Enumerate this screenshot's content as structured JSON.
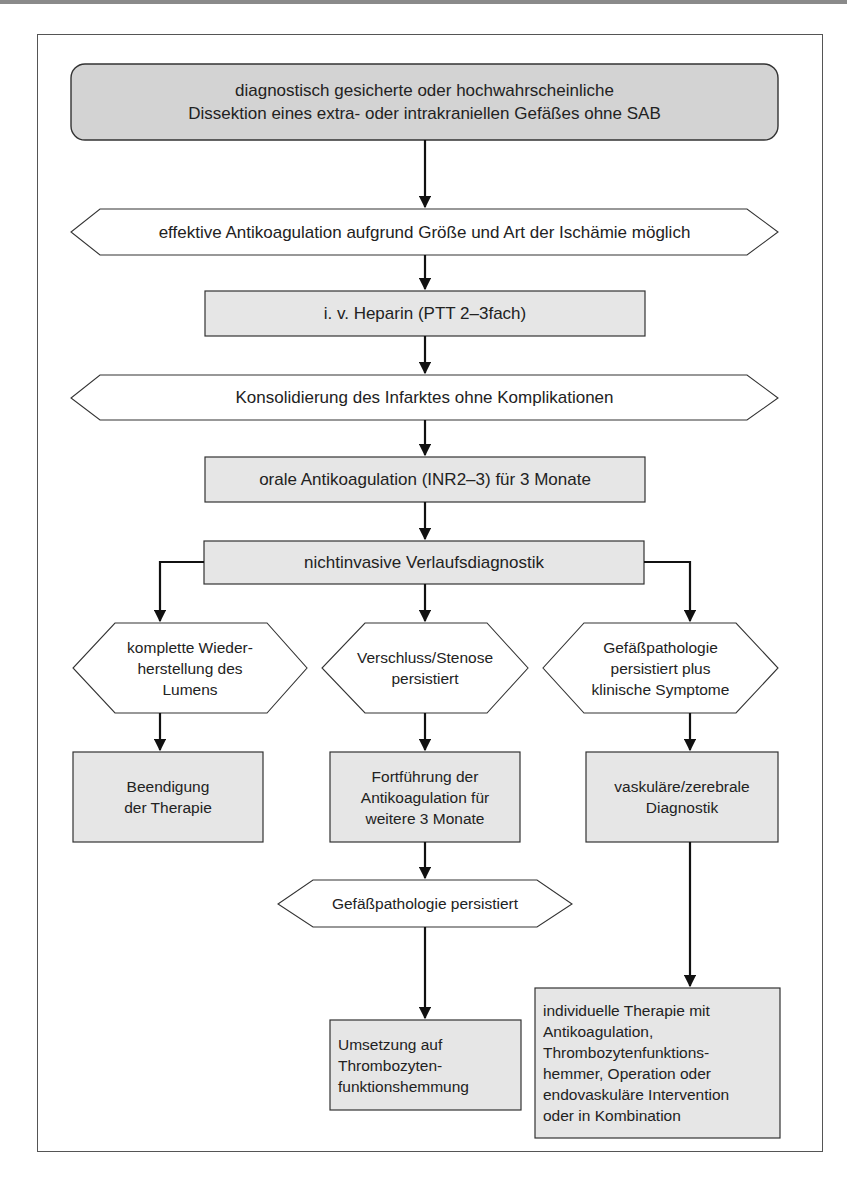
{
  "diagram": {
    "type": "flowchart",
    "language": "de",
    "colors": {
      "start_fill": "#d3d3d3",
      "box_fill": "#e6e6e6",
      "decision_fill": "#ffffff",
      "stroke": "#333333",
      "arrow": "#111111"
    },
    "nodes": {
      "start": {
        "shape": "rounded-rect",
        "label": "diagnostisch gesicherte oder hochwahrscheinliche\nDissektion eines extra- oder intrakraniellen Gefäßes ohne SAB"
      },
      "decision_anticoag": {
        "shape": "hexagon",
        "label": "effektive Antikoagulation aufgrund Größe und Art der Ischämie möglich"
      },
      "heparin": {
        "shape": "rect",
        "label": "i. v. Heparin (PTT 2–3fach)"
      },
      "decision_konsolidierung": {
        "shape": "hexagon",
        "label": "Konsolidierung des Infarktes ohne Komplikationen"
      },
      "oral_anticoag": {
        "shape": "rect",
        "label": "orale Antikoagulation (INR2–3) für 3 Monate"
      },
      "verlaufsdiagnostik": {
        "shape": "rect",
        "label": "nichtinvasive Verlaufsdiagnostik"
      },
      "decision_lumen": {
        "shape": "hexagon",
        "label": "komplette Wieder-\nherstellung des\nLumens"
      },
      "decision_stenose": {
        "shape": "hexagon",
        "label": "Verschluss/Stenose\npersistiert"
      },
      "decision_symptome": {
        "shape": "hexagon",
        "label": "Gefäßpathologie\npersistiert plus\nklinische Symptome"
      },
      "beendigung": {
        "shape": "rect",
        "label": "Beendigung\nder Therapie"
      },
      "fortfuehrung": {
        "shape": "rect",
        "label": "Fortführung der\nAntikoagulation für\nweitere 3 Monate"
      },
      "vaskulaere_diagnostik": {
        "shape": "rect",
        "label": "vaskuläre/zerebrale\nDiagnostik"
      },
      "decision_persistiert": {
        "shape": "hexagon",
        "label": "Gefäßpathologie persistiert"
      },
      "umsetzung": {
        "shape": "rect",
        "label": "Umsetzung auf\nThrombozyten-\nfunktionshemmung"
      },
      "individuelle_therapie": {
        "shape": "rect",
        "label": "individuelle Therapie mit\nAntikoagulation,\nThrombozytenfunktions-\nhemmer, Operation oder\nendovaskuläre Intervention\noder in Kombination"
      }
    },
    "edges": [
      [
        "start",
        "decision_anticoag"
      ],
      [
        "decision_anticoag",
        "heparin"
      ],
      [
        "heparin",
        "decision_konsolidierung"
      ],
      [
        "decision_konsolidierung",
        "oral_anticoag"
      ],
      [
        "oral_anticoag",
        "verlaufsdiagnostik"
      ],
      [
        "verlaufsdiagnostik",
        "decision_lumen"
      ],
      [
        "verlaufsdiagnostik",
        "decision_stenose"
      ],
      [
        "verlaufsdiagnostik",
        "decision_symptome"
      ],
      [
        "decision_lumen",
        "beendigung"
      ],
      [
        "decision_stenose",
        "fortfuehrung"
      ],
      [
        "decision_symptome",
        "vaskulaere_diagnostik"
      ],
      [
        "fortfuehrung",
        "decision_persistiert"
      ],
      [
        "decision_persistiert",
        "umsetzung"
      ],
      [
        "vaskulaere_diagnostik",
        "individuelle_therapie"
      ]
    ]
  }
}
